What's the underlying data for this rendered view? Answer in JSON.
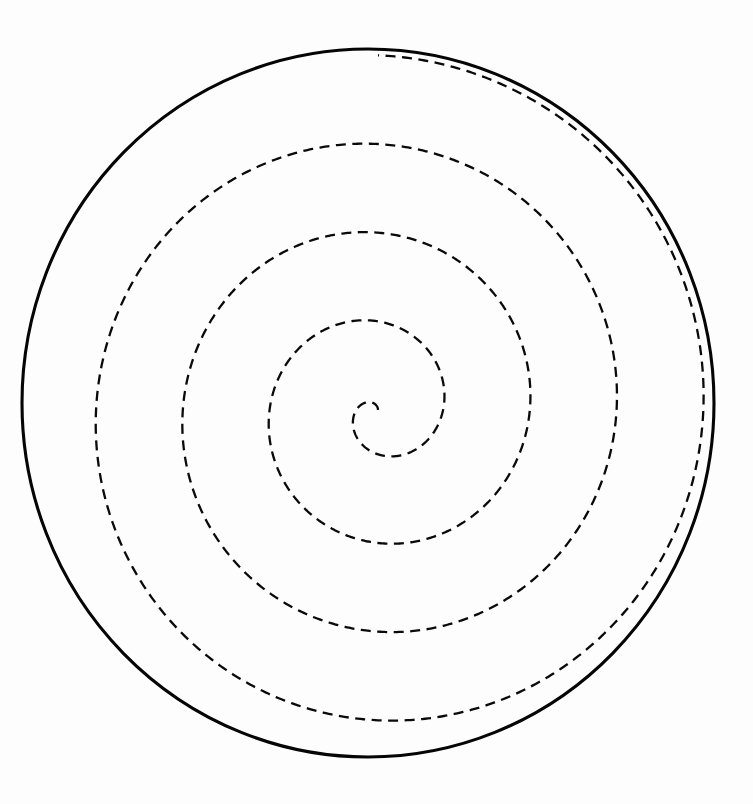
{
  "figure": {
    "background_color": "#fdfdfd",
    "width": 753,
    "height": 804
  },
  "chart_data": {
    "type": "line",
    "subtitle": "",
    "xlabel": "",
    "ylabel": "",
    "grid": false,
    "legend": false,
    "axes_visible": false,
    "tick_labels": [],
    "annotations": [],
    "coordinate_system": "polar",
    "xlim": [
      0,
      753
    ],
    "ylim": [
      0,
      804
    ],
    "series": [
      {
        "name": "boundary-circle",
        "kind": "circle",
        "style": "solid",
        "color": "#050505",
        "line_width": 3.1,
        "center": [
          368,
          403
        ],
        "radius_x": 346,
        "radius_y": 354
      },
      {
        "name": "archimedean-spiral",
        "kind": "spiral",
        "style": "dashed",
        "dash_pattern": [
          10,
          6.5
        ],
        "color": "#0a0a0a",
        "line_width": 2.3,
        "center": [
          378,
          410
        ],
        "turns": 4,
        "theta_start_deg": 90,
        "theta_end_deg": 1530,
        "r_start": 0,
        "r_end": 347,
        "growth_per_turn": 86.75,
        "direction": "counterclockwise-from-center",
        "endpoint": [
          367,
          757
        ],
        "radial_crossings_left_of_center": [
          112,
          193,
          282,
          342
        ],
        "radial_crossings_right_of_center": [
          408,
          455,
          542,
          625
        ],
        "radial_crossings_above_center": [
          142,
          228,
          320,
          367
        ],
        "radial_crossings_below_center": [
          423,
          470,
          543,
          637
        ]
      }
    ]
  },
  "labels": {
    "none_visible": ""
  }
}
